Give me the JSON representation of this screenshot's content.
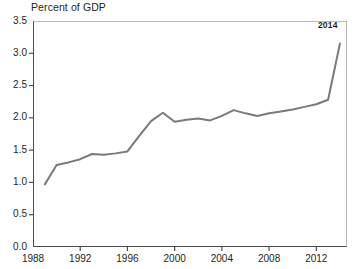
{
  "chart_data": {
    "type": "line",
    "title": "Percent of GDP",
    "subtitle": "",
    "xlabel": "",
    "ylabel": "",
    "xlim": [
      1988,
      2014.6
    ],
    "ylim": [
      0.0,
      3.5
    ],
    "grid": false,
    "legend": "none",
    "line_color": "#7a7a7a",
    "axis_color": "#4d4d4d",
    "frame_color": "#b9b9b9",
    "x": [
      1989,
      1990,
      1991,
      1992,
      1993,
      1994,
      1995,
      1996,
      1997,
      1998,
      1999,
      2000,
      2001,
      2002,
      2003,
      2004,
      2005,
      2006,
      2007,
      2008,
      2009,
      2010,
      2011,
      2012,
      2013,
      2014
    ],
    "values": [
      0.97,
      1.27,
      1.31,
      1.36,
      1.44,
      1.43,
      1.45,
      1.48,
      1.72,
      1.95,
      2.08,
      1.94,
      1.97,
      1.99,
      1.96,
      2.03,
      2.12,
      2.07,
      2.03,
      2.07,
      2.1,
      2.13,
      2.17,
      2.21,
      2.28,
      3.15
    ],
    "y_ticks": [
      {
        "value": 0.0,
        "label": "0.0"
      },
      {
        "value": 0.5,
        "label": "0.5"
      },
      {
        "value": 1.0,
        "label": "1.0"
      },
      {
        "value": 1.5,
        "label": "1.5"
      },
      {
        "value": 2.0,
        "label": "2.0"
      },
      {
        "value": 2.5,
        "label": "2.5"
      },
      {
        "value": 3.0,
        "label": "3.0"
      },
      {
        "value": 3.5,
        "label": "3.5"
      }
    ],
    "x_ticks": [
      {
        "value": 1988,
        "label": "1988"
      },
      {
        "value": 1992,
        "label": "1992"
      },
      {
        "value": 1996,
        "label": "1996"
      },
      {
        "value": 2000,
        "label": "2000"
      },
      {
        "value": 2004,
        "label": "2004"
      },
      {
        "value": 2008,
        "label": "2008"
      },
      {
        "value": 2012,
        "label": "2012"
      }
    ],
    "annotations": [
      {
        "text": "2014",
        "x": 2014,
        "y": 3.15
      }
    ]
  }
}
